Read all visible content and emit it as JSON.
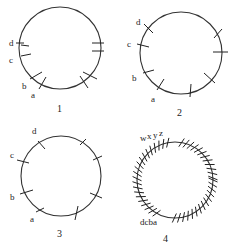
{
  "diagram": {
    "panels": [
      {
        "number": "1",
        "labels": [
          "a",
          "b",
          "c",
          "d"
        ]
      },
      {
        "number": "2",
        "labels": [
          "a",
          "b",
          "c",
          "d"
        ]
      },
      {
        "number": "3",
        "labels": [
          "a",
          "b",
          "c",
          "d"
        ]
      },
      {
        "number": "4",
        "labels_bottom": "dcba",
        "labels_top": [
          "w",
          "x",
          "y",
          "z"
        ]
      }
    ]
  },
  "colors": {
    "ink": "#222222",
    "background": "#ffffff"
  }
}
